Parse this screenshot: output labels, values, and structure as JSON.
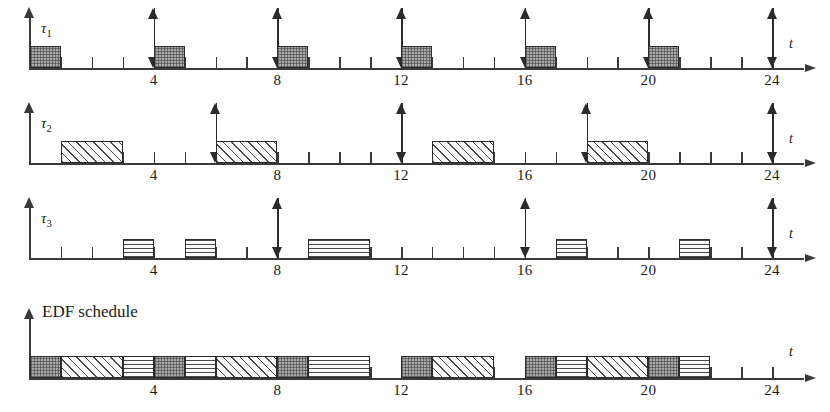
{
  "figure": {
    "kind": "real-time-scheduling-timeline",
    "axis_label": "t",
    "time_origin": 0,
    "time_end": 24,
    "tick_interval": 1,
    "labeled_ticks": [
      4,
      8,
      12,
      16,
      20,
      24
    ],
    "tick_labels": [
      "4",
      "8",
      "12",
      "16",
      "20",
      "24"
    ]
  },
  "rows": [
    {
      "id": "tau1",
      "label_base": "τ",
      "label_sub": "1",
      "axis_label": "t",
      "pattern": "dark-checker",
      "period": 4,
      "execution_time": 1,
      "releases": [
        0,
        4,
        8,
        12,
        16,
        20,
        24
      ],
      "blocks": [
        {
          "start": 0,
          "end": 1
        },
        {
          "start": 4,
          "end": 5
        },
        {
          "start": 8,
          "end": 9
        },
        {
          "start": 12,
          "end": 13
        },
        {
          "start": 16,
          "end": 17
        },
        {
          "start": 20,
          "end": 21
        }
      ]
    },
    {
      "id": "tau2",
      "label_base": "τ",
      "label_sub": "2",
      "axis_label": "t",
      "pattern": "diagonal-hatch",
      "period": 6,
      "execution_time": 2,
      "releases": [
        0,
        6,
        12,
        18,
        24
      ],
      "blocks": [
        {
          "start": 1,
          "end": 3
        },
        {
          "start": 6,
          "end": 8
        },
        {
          "start": 13,
          "end": 15
        },
        {
          "start": 18,
          "end": 20
        }
      ]
    },
    {
      "id": "tau3",
      "label_base": "τ",
      "label_sub": "3",
      "axis_label": "t",
      "pattern": "horizontal-hatch",
      "period": 8,
      "execution_time": 3,
      "releases": [
        0,
        8,
        16,
        24
      ],
      "blocks": [
        {
          "start": 3,
          "end": 4
        },
        {
          "start": 5,
          "end": 6
        },
        {
          "start": 9,
          "end": 11
        },
        {
          "start": 17,
          "end": 18
        },
        {
          "start": 21,
          "end": 22
        }
      ]
    }
  ],
  "schedule": {
    "id": "edf",
    "label": "EDF schedule",
    "axis_label": "t",
    "blocks": [
      {
        "start": 0,
        "end": 1,
        "task": "tau1"
      },
      {
        "start": 1,
        "end": 3,
        "task": "tau2"
      },
      {
        "start": 3,
        "end": 4,
        "task": "tau3"
      },
      {
        "start": 4,
        "end": 5,
        "task": "tau1"
      },
      {
        "start": 5,
        "end": 6,
        "task": "tau3"
      },
      {
        "start": 6,
        "end": 8,
        "task": "tau2"
      },
      {
        "start": 8,
        "end": 9,
        "task": "tau1"
      },
      {
        "start": 9,
        "end": 11,
        "task": "tau3"
      },
      {
        "start": 12,
        "end": 13,
        "task": "tau1"
      },
      {
        "start": 13,
        "end": 15,
        "task": "tau2"
      },
      {
        "start": 16,
        "end": 17,
        "task": "tau1"
      },
      {
        "start": 17,
        "end": 18,
        "task": "tau3"
      },
      {
        "start": 18,
        "end": 20,
        "task": "tau2"
      },
      {
        "start": 20,
        "end": 21,
        "task": "tau1"
      },
      {
        "start": 21,
        "end": 22,
        "task": "tau3"
      }
    ],
    "idle_intervals": [
      {
        "start": 11,
        "end": 12
      },
      {
        "start": 15,
        "end": 16
      },
      {
        "start": 22,
        "end": 24
      }
    ]
  },
  "colors": {
    "ink": "#2b2b2b",
    "axis": "#3a3a3a",
    "tau1_fill": "#a8a8a8",
    "tau2_fill": "#fbfbfb",
    "tau3_fill": "#fcfcfc"
  }
}
